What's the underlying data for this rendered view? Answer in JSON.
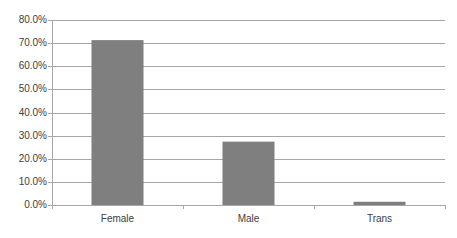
{
  "chart_data": {
    "type": "bar",
    "title": "",
    "xlabel": "",
    "ylabel": "",
    "categories": [
      "Female",
      "Male",
      "Trans"
    ],
    "values": [
      71.3,
      27.4,
      1.4
    ],
    "value_format": "percent",
    "ylim": [
      0,
      80
    ],
    "yticks": [
      "0.0%",
      "10.0%",
      "20.0%",
      "30.0%",
      "40.0%",
      "50.0%",
      "60.0%",
      "70.0%",
      "80.0%"
    ],
    "grid": true,
    "legend": "none",
    "colors": {
      "bar": "#7f7f7f",
      "grid": "#a6a6a6",
      "axis": "#a6a6a6"
    }
  }
}
